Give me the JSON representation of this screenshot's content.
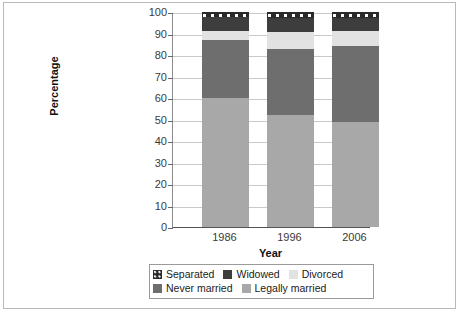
{
  "chart_data": {
    "type": "bar",
    "stacked": true,
    "title": "",
    "xlabel": "Year",
    "ylabel": "Percentage",
    "categories": [
      "1986",
      "1996",
      "2006"
    ],
    "ylim": [
      0,
      100
    ],
    "yticks": [
      0,
      10,
      20,
      30,
      40,
      50,
      60,
      70,
      80,
      90,
      100
    ],
    "ytick_labels": [
      "0",
      "10",
      "20",
      "30",
      "40",
      "50",
      "60",
      "70",
      "80",
      "90",
      "100"
    ],
    "grid": true,
    "legend_position": "bottom",
    "series": [
      {
        "name": "Legally married",
        "color": "#a8a8a8",
        "values": [
          60,
          52,
          49
        ]
      },
      {
        "name": "Never married",
        "color": "#6e6e6e",
        "values": [
          27,
          31,
          35
        ]
      },
      {
        "name": "Divorced",
        "color": "#e2e2e2",
        "values": [
          4,
          7.5,
          7
        ]
      },
      {
        "name": "Widowed",
        "color": "#3d3d3d",
        "values": [
          6.5,
          6.5,
          6
        ]
      },
      {
        "name": "Separated",
        "color": "#2a2a2a",
        "values": [
          2.5,
          3,
          3
        ]
      }
    ],
    "legend_order": [
      "Separated",
      "Widowed",
      "Divorced",
      "Never married",
      "Legally married"
    ]
  },
  "axes": {
    "y_title": "Percentage",
    "x_title": "Year"
  },
  "legend": {
    "row1": [
      {
        "label": "Separated",
        "swatch": "sw-separated"
      },
      {
        "label": "Widowed",
        "swatch": "sw-widowed"
      },
      {
        "label": "Divorced",
        "swatch": "sw-divorced"
      }
    ],
    "row2": [
      {
        "label": "Never married",
        "swatch": "sw-never"
      },
      {
        "label": "Legally married",
        "swatch": "sw-legally"
      }
    ]
  }
}
